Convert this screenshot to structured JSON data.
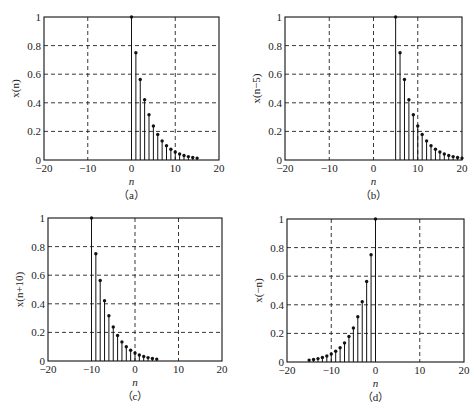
{
  "chart_data": [
    {
      "id": "a",
      "type": "stem",
      "caption": "（a）",
      "xlabel": "n",
      "ylabel": "x(n)",
      "xlim": [
        -20,
        20
      ],
      "ylim": [
        0,
        1
      ],
      "xticks": [
        -20,
        -10,
        0,
        10,
        20
      ],
      "yticks": [
        0,
        0.2,
        0.4,
        0.6,
        0.8,
        1
      ],
      "grid": "dashed",
      "x": [
        0,
        1,
        2,
        3,
        4,
        5,
        6,
        7,
        8,
        9,
        10,
        11,
        12,
        13,
        14,
        15
      ],
      "values": [
        1,
        0.75,
        0.5625,
        0.4219,
        0.3164,
        0.2373,
        0.178,
        0.1335,
        0.1001,
        0.0751,
        0.0563,
        0.0422,
        0.0317,
        0.0238,
        0.0178,
        0.0134
      ]
    },
    {
      "id": "b",
      "type": "stem",
      "caption": "（b）",
      "xlabel": "n",
      "ylabel": "x(n−5)",
      "xlim": [
        -20,
        20
      ],
      "ylim": [
        0,
        1
      ],
      "xticks": [
        -20,
        -10,
        0,
        10,
        20
      ],
      "yticks": [
        0,
        0.2,
        0.4,
        0.6,
        0.8,
        1
      ],
      "grid": "dashed",
      "x": [
        5,
        6,
        7,
        8,
        9,
        10,
        11,
        12,
        13,
        14,
        15,
        16,
        17,
        18,
        19,
        20
      ],
      "values": [
        1,
        0.75,
        0.5625,
        0.4219,
        0.3164,
        0.2373,
        0.178,
        0.1335,
        0.1001,
        0.0751,
        0.0563,
        0.0422,
        0.0317,
        0.0238,
        0.0178,
        0.0134
      ]
    },
    {
      "id": "c",
      "type": "stem",
      "caption": "（c）",
      "xlabel": "n",
      "ylabel": "x(n+10)",
      "xlim": [
        -20,
        20
      ],
      "ylim": [
        0,
        1
      ],
      "xticks": [
        -20,
        -10,
        0,
        10,
        20
      ],
      "yticks": [
        0,
        0.2,
        0.4,
        0.6,
        0.8,
        1
      ],
      "grid": "dashed",
      "x": [
        -10,
        -9,
        -8,
        -7,
        -6,
        -5,
        -4,
        -3,
        -2,
        -1,
        0,
        1,
        2,
        3,
        4,
        5
      ],
      "values": [
        1,
        0.75,
        0.5625,
        0.4219,
        0.3164,
        0.2373,
        0.178,
        0.1335,
        0.1001,
        0.0751,
        0.0563,
        0.0422,
        0.0317,
        0.0238,
        0.0178,
        0.0134
      ]
    },
    {
      "id": "d",
      "type": "stem",
      "caption": "（d）",
      "xlabel": "n",
      "ylabel": "x(−n)",
      "xlim": [
        -20,
        20
      ],
      "ylim": [
        0,
        1
      ],
      "xticks": [
        -20,
        -10,
        0,
        10,
        20
      ],
      "yticks": [
        0,
        0.2,
        0.4,
        0.6,
        0.8,
        1
      ],
      "grid": "dashed",
      "x": [
        0,
        -1,
        -2,
        -3,
        -4,
        -5,
        -6,
        -7,
        -8,
        -9,
        -10,
        -11,
        -12,
        -13,
        -14,
        -15
      ],
      "values": [
        1,
        0.75,
        0.5625,
        0.4219,
        0.3164,
        0.2373,
        0.178,
        0.1335,
        0.1001,
        0.0751,
        0.0563,
        0.0422,
        0.0317,
        0.0238,
        0.0178,
        0.0134
      ]
    }
  ],
  "tick_labels": {
    "x": [
      "−20",
      "−10",
      "0",
      "10",
      "20"
    ],
    "y": [
      "0",
      "0.2",
      "0.4",
      "0.6",
      "0.8",
      "1"
    ]
  }
}
